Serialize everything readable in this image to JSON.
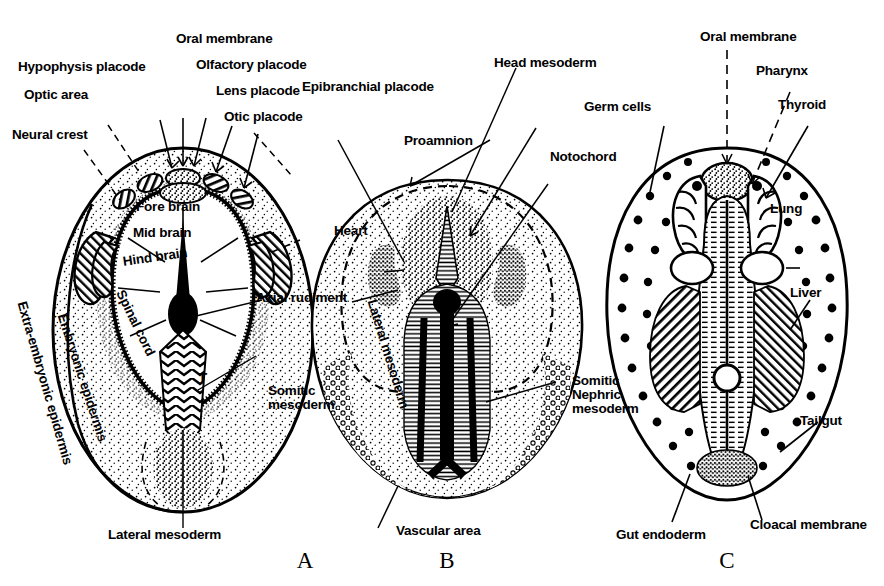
{
  "figure": {
    "type": "embryology-fate-map",
    "background_color": "#ffffff",
    "ink_color": "#000000",
    "panel_count": 3
  },
  "panels": [
    {
      "id": "A",
      "letter": "A",
      "stage": "neurula / presomite fate map",
      "labels": [
        "Hypophysis placode",
        "Optic area",
        "Neural crest",
        "Oral membrane",
        "Olfactory placode",
        "Lens placode",
        "Otic placode",
        "Fore brain",
        "Mid brain",
        "Hind brain",
        "Spinal cord",
        "T",
        "Extra-embryonic epidermis",
        "Embryonic epidermis",
        "Axial rudiment",
        "Somitic mesoderm",
        "Lateral mesoderm"
      ]
    },
    {
      "id": "B",
      "letter": "B",
      "stage": "head-process / proamnion stage",
      "labels": [
        "Epibranchial placode",
        "Proamnion",
        "Head mesoderm",
        "Notochord",
        "Heart",
        "Lateral mesoderm",
        "Somitic",
        "Nephric",
        "mesoderm",
        "Vascular area"
      ]
    },
    {
      "id": "C",
      "letter": "C",
      "stage": "organ rudiment stage",
      "labels": [
        "Oral membrane",
        "Pharynx",
        "Thyroid",
        "Germ cells",
        "Lung",
        "Liver",
        "Tailgut",
        "Cloacal membrane",
        "Gut endoderm"
      ]
    }
  ],
  "labels": {
    "hypophysis_placode": "Hypophysis placode",
    "optic_area": "Optic area",
    "neural_crest": "Neural crest",
    "oral_membrane_a": "Oral membrane",
    "olfactory_placode": "Olfactory placode",
    "lens_placode": "Lens placode",
    "otic_placode": "Otic placode",
    "fore_brain": "Fore brain",
    "mid_brain": "Mid brain",
    "hind_brain": "Hind brain",
    "spinal_cord": "Spinal cord",
    "t_marker": "T",
    "extra_embryonic_epidermis": "Extra-embryonic epidermis",
    "embryonic_epidermis": "Embryonic epidermis",
    "axial_rudiment": "Axial rudiment",
    "somitic_mesoderm_a": "Somitic mesoderm",
    "lateral_mesoderm_a": "Lateral mesoderm",
    "epibranchial_placode": "Epibranchial placode",
    "proamnion": "Proamnion",
    "head_mesoderm": "Head mesoderm",
    "notochord": "Notochord",
    "heart": "Heart",
    "lateral_mesoderm_b": "Lateral mesoderm",
    "somitic_b": "Somitic",
    "nephric_b": "Nephric",
    "mesoderm_b": "mesoderm",
    "vascular_area": "Vascular area",
    "oral_membrane_c": "Oral membrane",
    "pharynx": "Pharynx",
    "thyroid": "Thyroid",
    "germ_cells": "Germ cells",
    "lung": "Lung",
    "liver": "Liver",
    "tailgut": "Tailgut",
    "cloacal_membrane": "Cloacal membrane",
    "gut_endoderm": "Gut endoderm",
    "panel_a": "A",
    "panel_b": "B",
    "panel_c": "C"
  }
}
